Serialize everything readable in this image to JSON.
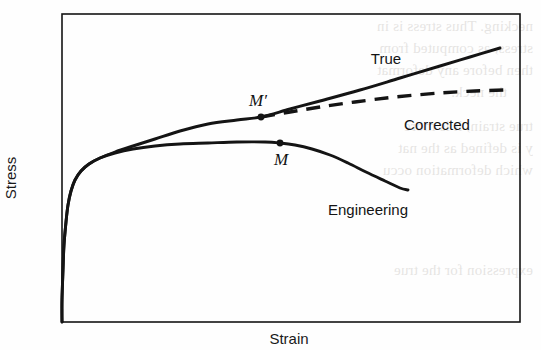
{
  "figure": {
    "kind": "stress-strain-curve-figure",
    "background_color": "#fefefe",
    "ink_color": "#141414",
    "frame": {
      "x0": 62,
      "y0": 14,
      "x1": 520,
      "y1": 322
    }
  },
  "axes": {
    "ylabel": "Stress",
    "xlabel": "Strain"
  },
  "labels": {
    "true": "True",
    "corrected": "Corrected",
    "engineering": "Engineering",
    "m_prime": "M′",
    "m": "M"
  },
  "ghost_text": {
    "note": "faint mirrored bleed-through from reverse side of printed page",
    "lines": [
      {
        "text": "necking. Thus stress is in",
        "x": 8,
        "y": 18
      },
      {
        "text": "stress, as computed from",
        "x": 8,
        "y": 40
      },
      {
        "text": "then before any deformat",
        "x": 8,
        "y": 62
      },
      {
        "text": "the neck.",
        "x": 34,
        "y": 84
      },
      {
        "text": "true strain, it is more",
        "x": 8,
        "y": 118
      },
      {
        "text": "y is defined as the nat",
        "x": 8,
        "y": 140
      },
      {
        "text": "which deformation occu",
        "x": 8,
        "y": 162
      },
      {
        "text": "expression for the true",
        "x": 8,
        "y": 262
      }
    ]
  },
  "chart_data": {
    "type": "line",
    "title": "",
    "xlabel": "Strain",
    "ylabel": "Stress",
    "grid": false,
    "axis_ticks": false,
    "legend": "inline-annotations",
    "xlim": [
      62,
      520
    ],
    "ylim": [
      322,
      14
    ],
    "axis_note": "Axes are schematic/qualitative with no numeric tick labels; coordinates below are pixel positions within the plot frame.",
    "annotations": [
      {
        "name": "m_prime",
        "label": "M′",
        "x": 261,
        "y": 117,
        "marker": "filled-circle",
        "description": "Point of maximum load on the true stress-strain curve; onset of necking"
      },
      {
        "name": "m",
        "label": "M",
        "x": 280,
        "y": 143,
        "marker": "filled-circle",
        "description": "Point of maximum load (tensile strength) on the engineering stress-strain curve"
      }
    ],
    "series": [
      {
        "name": "Engineering",
        "style": "solid",
        "label_position": {
          "x": 368,
          "y": 209
        },
        "points": [
          [
            62,
            322
          ],
          [
            62,
            300
          ],
          [
            63,
            270
          ],
          [
            64,
            245
          ],
          [
            66,
            222
          ],
          [
            68,
            205
          ],
          [
            71,
            191
          ],
          [
            75,
            180
          ],
          [
            81,
            171
          ],
          [
            89,
            164
          ],
          [
            100,
            158
          ],
          [
            115,
            153
          ],
          [
            133,
            149
          ],
          [
            155,
            146
          ],
          [
            180,
            144
          ],
          [
            208,
            143
          ],
          [
            237,
            142
          ],
          [
            265,
            142
          ],
          [
            280,
            143
          ],
          [
            295,
            145
          ],
          [
            312,
            149
          ],
          [
            330,
            155
          ],
          [
            348,
            163
          ],
          [
            366,
            172
          ],
          [
            385,
            181
          ],
          [
            400,
            188
          ],
          [
            408,
            190
          ]
        ]
      },
      {
        "name": "True",
        "style": "solid",
        "label_position": {
          "x": 386,
          "y": 58
        },
        "points": [
          [
            62,
            322
          ],
          [
            62,
            300
          ],
          [
            63,
            270
          ],
          [
            64,
            245
          ],
          [
            66,
            222
          ],
          [
            68,
            205
          ],
          [
            71,
            191
          ],
          [
            75,
            180
          ],
          [
            81,
            171
          ],
          [
            89,
            164
          ],
          [
            100,
            158
          ],
          [
            115,
            152
          ],
          [
            133,
            146
          ],
          [
            155,
            139
          ],
          [
            180,
            131
          ],
          [
            208,
            124
          ],
          [
            237,
            120
          ],
          [
            261,
            117
          ],
          [
            290,
            109
          ],
          [
            320,
            101
          ],
          [
            360,
            90
          ],
          [
            400,
            78
          ],
          [
            440,
            66
          ],
          [
            470,
            57
          ],
          [
            500,
            48
          ]
        ]
      },
      {
        "name": "Corrected",
        "style": "dashed",
        "dash_pattern": [
          14,
          9
        ],
        "label_position": {
          "x": 437,
          "y": 124
        },
        "points": [
          [
            261,
            117
          ],
          [
            290,
            112
          ],
          [
            320,
            107
          ],
          [
            355,
            102
          ],
          [
            395,
            97
          ],
          [
            440,
            93
          ],
          [
            475,
            91
          ],
          [
            505,
            90
          ]
        ]
      }
    ]
  }
}
